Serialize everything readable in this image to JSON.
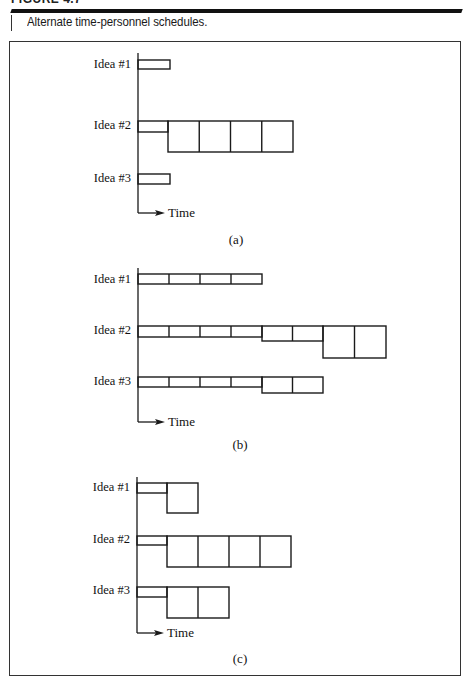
{
  "figure": {
    "label": "FIGURE 4.7",
    "caption": "Alternate time-personnel schedules.",
    "colors": {
      "line": "#1a1a1a",
      "background": "#ffffff",
      "rule": "#111111"
    }
  },
  "diagram": {
    "axis_label": "Time",
    "panels": [
      {
        "id": "a",
        "label": "(a)",
        "axis": {
          "x": 138,
          "top": 53,
          "bottom": 213
        },
        "label_pos": {
          "x": 236,
          "y": 244
        },
        "ideas": [
          {
            "name": "Idea #1",
            "label_y": 68,
            "top": 60,
            "segments": [
              {
                "x1": 138,
                "x2": 170,
                "bottom": 69,
                "cells": 1
              }
            ]
          },
          {
            "name": "Idea #2",
            "label_y": 129,
            "top": 121,
            "segments": [
              {
                "x1": 138,
                "x2": 168,
                "bottom": 132,
                "cells": 1
              },
              {
                "x1": 168,
                "x2": 293,
                "bottom": 152,
                "cells": 4
              }
            ]
          },
          {
            "name": "Idea #3",
            "label_y": 182,
            "top": 174,
            "segments": [
              {
                "x1": 138,
                "x2": 170,
                "bottom": 184,
                "cells": 1
              }
            ]
          }
        ]
      },
      {
        "id": "b",
        "label": "(b)",
        "axis": {
          "x": 138,
          "top": 268,
          "bottom": 422
        },
        "label_pos": {
          "x": 240,
          "y": 449
        },
        "ideas": [
          {
            "name": "Idea #1",
            "label_y": 283,
            "top": 274,
            "segments": [
              {
                "x1": 138,
                "x2": 262,
                "bottom": 284,
                "cells": 4
              }
            ]
          },
          {
            "name": "Idea #2",
            "label_y": 334,
            "top": 326,
            "segments": [
              {
                "x1": 138,
                "x2": 262,
                "bottom": 337,
                "cells": 4
              },
              {
                "x1": 262,
                "x2": 323,
                "bottom": 341,
                "cells": 2
              },
              {
                "x1": 323,
                "x2": 386,
                "bottom": 358,
                "cells": 2
              }
            ]
          },
          {
            "name": "Idea #3",
            "label_y": 385,
            "top": 377,
            "segments": [
              {
                "x1": 138,
                "x2": 262,
                "bottom": 387,
                "cells": 4
              },
              {
                "x1": 262,
                "x2": 323,
                "bottom": 393,
                "cells": 2
              }
            ]
          }
        ]
      },
      {
        "id": "c",
        "label": "(c)",
        "axis": {
          "x": 137,
          "top": 477,
          "bottom": 633
        },
        "label_pos": {
          "x": 240,
          "y": 663
        },
        "ideas": [
          {
            "name": "Idea #1",
            "label_y": 491,
            "top": 483,
            "segments": [
              {
                "x1": 137,
                "x2": 167,
                "bottom": 493,
                "cells": 1
              },
              {
                "x1": 167,
                "x2": 198,
                "bottom": 513,
                "cells": 1
              }
            ]
          },
          {
            "name": "Idea #2",
            "label_y": 543,
            "top": 536,
            "segments": [
              {
                "x1": 137,
                "x2": 167,
                "bottom": 545,
                "cells": 1
              },
              {
                "x1": 167,
                "x2": 291,
                "bottom": 567,
                "cells": 4
              }
            ]
          },
          {
            "name": "Idea #3",
            "label_y": 594,
            "top": 587,
            "segments": [
              {
                "x1": 137,
                "x2": 167,
                "bottom": 597,
                "cells": 1
              },
              {
                "x1": 167,
                "x2": 229,
                "bottom": 618,
                "cells": 2
              }
            ]
          }
        ]
      }
    ]
  }
}
